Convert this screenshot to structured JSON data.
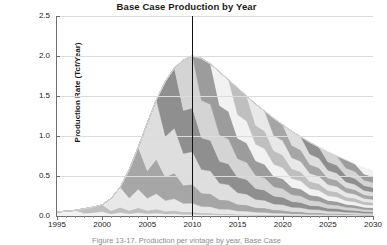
{
  "chart": {
    "title": "Base Case Production by Year",
    "caption": "Figure 13-17. Production per vintage by year, Base Case",
    "marker_line_year": 2010,
    "marker_line_color": "#111111",
    "background": "#ffffff",
    "gridline_color": "#dcdcdc",
    "axis_color": "#6f6f6f"
  },
  "chart_data": {
    "type": "area",
    "title": "Base Case Production by Year",
    "xlabel": "",
    "ylabel": "Production Rate (Tcf/Year)",
    "xlim": [
      1995,
      2030
    ],
    "ylim": [
      0.0,
      2.5
    ],
    "grid": true,
    "legend": "none",
    "stacked": true,
    "x_ticks": [
      1995,
      2000,
      2005,
      2010,
      2015,
      2020,
      2025,
      2030
    ],
    "x_tick_labels": [
      "1995",
      "2000",
      "2005",
      "2010",
      "2015",
      "2020",
      "2025",
      "2030"
    ],
    "x_minor_tick_interval": 1,
    "y_ticks": [
      0.0,
      0.5,
      1.0,
      1.5,
      2.0,
      2.5
    ],
    "y_tick_labels": [
      "0.0",
      "0.5",
      "1.0",
      "1.5",
      "2.0",
      "2.5"
    ],
    "annotations": [
      {
        "type": "vline",
        "x": 2010,
        "color": "#111111",
        "label": ""
      }
    ],
    "band_colors": [
      "#f2f2f2",
      "#bfbfbf",
      "#e8e8e8",
      "#a6a6a6",
      "#dedede",
      "#8f8f8f",
      "#d4d4d4",
      "#9c9c9c"
    ],
    "x": [
      1995,
      1996,
      1997,
      1998,
      1999,
      2000,
      2001,
      2002,
      2003,
      2004,
      2005,
      2006,
      2007,
      2008,
      2009,
      2010,
      2011,
      2012,
      2013,
      2014,
      2015,
      2016,
      2017,
      2018,
      2019,
      2020,
      2021,
      2022,
      2023,
      2024,
      2025,
      2026,
      2027,
      2028,
      2029,
      2030
    ],
    "total": [
      0.05,
      0.06,
      0.07,
      0.09,
      0.11,
      0.14,
      0.22,
      0.36,
      0.58,
      0.86,
      1.16,
      1.45,
      1.68,
      1.85,
      1.95,
      2.0,
      1.97,
      1.9,
      1.8,
      1.7,
      1.6,
      1.5,
      1.4,
      1.31,
      1.22,
      1.14,
      1.06,
      0.99,
      0.92,
      0.86,
      0.8,
      0.75,
      0.7,
      0.65,
      0.61,
      0.57
    ],
    "series": [
      {
        "name": "Vintage 1995",
        "start_year": 1995,
        "peak": 0.05,
        "values": [
          0.05,
          0.045,
          0.04,
          0.036,
          0.033,
          0.03,
          0.027,
          0.025,
          0.023,
          0.021,
          0.019,
          0.018,
          0.016,
          0.015,
          0.014,
          0.013,
          0.012,
          0.011,
          0.01,
          0.01,
          0.009,
          0.008,
          0.008,
          0.007,
          0.007,
          0.006,
          0.006,
          0.005,
          0.005,
          0.005,
          0.004,
          0.004,
          0.004,
          0.003,
          0.003,
          0.003
        ]
      },
      {
        "name": "Vintage 1998",
        "start_year": 1998,
        "peak": 0.06,
        "values": [
          0,
          0,
          0,
          0.06,
          0.054,
          0.048,
          0.043,
          0.039,
          0.035,
          0.032,
          0.029,
          0.026,
          0.024,
          0.022,
          0.02,
          0.018,
          0.017,
          0.015,
          0.014,
          0.013,
          0.012,
          0.011,
          0.01,
          0.009,
          0.009,
          0.008,
          0.007,
          0.007,
          0.006,
          0.006,
          0.005,
          0.005,
          0.005,
          0.004,
          0.004,
          0.004
        ]
      },
      {
        "name": "Vintage 2001",
        "start_year": 2001,
        "peak": 0.16,
        "values": [
          0,
          0,
          0,
          0,
          0,
          0,
          0.16,
          0.145,
          0.131,
          0.119,
          0.108,
          0.098,
          0.089,
          0.081,
          0.074,
          0.067,
          0.061,
          0.056,
          0.051,
          0.047,
          0.043,
          0.039,
          0.036,
          0.033,
          0.03,
          0.028,
          0.025,
          0.023,
          0.021,
          0.02,
          0.018,
          0.017,
          0.015,
          0.014,
          0.013,
          0.012
        ]
      },
      {
        "name": "Vintage 2003",
        "start_year": 2003,
        "peak": 0.3,
        "values": [
          0,
          0,
          0,
          0,
          0,
          0,
          0,
          0,
          0.3,
          0.27,
          0.243,
          0.219,
          0.197,
          0.178,
          0.16,
          0.144,
          0.13,
          0.117,
          0.105,
          0.095,
          0.085,
          0.077,
          0.069,
          0.062,
          0.056,
          0.05,
          0.045,
          0.041,
          0.037,
          0.033,
          0.03,
          0.027,
          0.024,
          0.022,
          0.02,
          0.018
        ]
      },
      {
        "name": "Vintage 2005",
        "start_year": 2005,
        "peak": 0.42,
        "values": [
          0,
          0,
          0,
          0,
          0,
          0,
          0,
          0,
          0,
          0,
          0.42,
          0.378,
          0.34,
          0.306,
          0.276,
          0.248,
          0.223,
          0.201,
          0.181,
          0.163,
          0.147,
          0.132,
          0.119,
          0.107,
          0.096,
          0.086,
          0.078,
          0.07,
          0.063,
          0.057,
          0.051,
          0.046,
          0.041,
          0.037,
          0.033,
          0.03
        ]
      },
      {
        "name": "Vintage 2007",
        "start_year": 2007,
        "peak": 0.46,
        "values": [
          0,
          0,
          0,
          0,
          0,
          0,
          0,
          0,
          0,
          0,
          0,
          0,
          0.46,
          0.414,
          0.373,
          0.335,
          0.302,
          0.272,
          0.244,
          0.22,
          0.198,
          0.178,
          0.16,
          0.144,
          0.13,
          0.117,
          0.105,
          0.095,
          0.085,
          0.077,
          0.069,
          0.062,
          0.056,
          0.05,
          0.045,
          0.041
        ]
      },
      {
        "name": "Vintage 2009",
        "start_year": 2009,
        "peak": 0.44,
        "values": [
          0,
          0,
          0,
          0,
          0,
          0,
          0,
          0,
          0,
          0,
          0,
          0,
          0,
          0,
          0.44,
          0.396,
          0.356,
          0.321,
          0.289,
          0.26,
          0.234,
          0.21,
          0.189,
          0.17,
          0.153,
          0.138,
          0.124,
          0.112,
          0.101,
          0.091,
          0.082,
          0.073,
          0.066,
          0.059,
          0.053,
          0.048
        ]
      },
      {
        "name": "Vintage 2011",
        "start_year": 2011,
        "peak": 0.4,
        "values": [
          0,
          0,
          0,
          0,
          0,
          0,
          0,
          0,
          0,
          0,
          0,
          0,
          0,
          0,
          0,
          0,
          0.4,
          0.36,
          0.324,
          0.292,
          0.262,
          0.236,
          0.213,
          0.191,
          0.172,
          0.155,
          0.139,
          0.125,
          0.113,
          0.102,
          0.092,
          0.082,
          0.074,
          0.067,
          0.06,
          0.054
        ]
      },
      {
        "name": "Vintage 2013",
        "start_year": 2013,
        "peak": 0.37,
        "values": [
          0,
          0,
          0,
          0,
          0,
          0,
          0,
          0,
          0,
          0,
          0,
          0,
          0,
          0,
          0,
          0,
          0,
          0,
          0.37,
          0.333,
          0.3,
          0.27,
          0.243,
          0.219,
          0.197,
          0.177,
          0.159,
          0.143,
          0.129,
          0.116,
          0.105,
          0.094,
          0.085,
          0.076,
          0.069,
          0.062
        ]
      },
      {
        "name": "Vintage 2015",
        "start_year": 2015,
        "peak": 0.34,
        "values": [
          0,
          0,
          0,
          0,
          0,
          0,
          0,
          0,
          0,
          0,
          0,
          0,
          0,
          0,
          0,
          0,
          0,
          0,
          0,
          0,
          0.34,
          0.306,
          0.275,
          0.248,
          0.223,
          0.201,
          0.181,
          0.163,
          0.146,
          0.132,
          0.119,
          0.107,
          0.096,
          0.086,
          0.078,
          0.07
        ]
      },
      {
        "name": "Vintage 2017",
        "start_year": 2017,
        "peak": 0.31,
        "values": [
          0,
          0,
          0,
          0,
          0,
          0,
          0,
          0,
          0,
          0,
          0,
          0,
          0,
          0,
          0,
          0,
          0,
          0,
          0,
          0,
          0,
          0,
          0.31,
          0.279,
          0.251,
          0.226,
          0.203,
          0.183,
          0.165,
          0.148,
          0.133,
          0.12,
          0.108,
          0.097,
          0.087,
          0.079
        ]
      },
      {
        "name": "Vintage 2019",
        "start_year": 2019,
        "peak": 0.28,
        "values": [
          0,
          0,
          0,
          0,
          0,
          0,
          0,
          0,
          0,
          0,
          0,
          0,
          0,
          0,
          0,
          0,
          0,
          0,
          0,
          0,
          0,
          0,
          0,
          0,
          0.28,
          0.252,
          0.227,
          0.204,
          0.184,
          0.165,
          0.149,
          0.134,
          0.12,
          0.108,
          0.098,
          0.088
        ]
      },
      {
        "name": "Vintage 2021",
        "start_year": 2021,
        "peak": 0.26,
        "values": [
          0,
          0,
          0,
          0,
          0,
          0,
          0,
          0,
          0,
          0,
          0,
          0,
          0,
          0,
          0,
          0,
          0,
          0,
          0,
          0,
          0,
          0,
          0,
          0,
          0,
          0,
          0.26,
          0.234,
          0.211,
          0.19,
          0.171,
          0.153,
          0.138,
          0.124,
          0.112,
          0.101
        ]
      },
      {
        "name": "Vintage 2023",
        "start_year": 2023,
        "peak": 0.24,
        "values": [
          0,
          0,
          0,
          0,
          0,
          0,
          0,
          0,
          0,
          0,
          0,
          0,
          0,
          0,
          0,
          0,
          0,
          0,
          0,
          0,
          0,
          0,
          0,
          0,
          0,
          0,
          0,
          0,
          0.24,
          0.216,
          0.194,
          0.175,
          0.157,
          0.142,
          0.127,
          0.115
        ]
      },
      {
        "name": "Vintage 2025",
        "start_year": 2025,
        "peak": 0.22,
        "values": [
          0,
          0,
          0,
          0,
          0,
          0,
          0,
          0,
          0,
          0,
          0,
          0,
          0,
          0,
          0,
          0,
          0,
          0,
          0,
          0,
          0,
          0,
          0,
          0,
          0,
          0,
          0,
          0,
          0,
          0,
          0.22,
          0.198,
          0.178,
          0.16,
          0.144,
          0.13
        ]
      },
      {
        "name": "Vintage 2027",
        "start_year": 2027,
        "peak": 0.2,
        "values": [
          0,
          0,
          0,
          0,
          0,
          0,
          0,
          0,
          0,
          0,
          0,
          0,
          0,
          0,
          0,
          0,
          0,
          0,
          0,
          0,
          0,
          0,
          0,
          0,
          0,
          0,
          0,
          0,
          0,
          0,
          0,
          0,
          0.2,
          0.18,
          0.162,
          0.146
        ]
      },
      {
        "name": "Vintage 2029",
        "start_year": 2029,
        "peak": 0.18,
        "values": [
          0,
          0,
          0,
          0,
          0,
          0,
          0,
          0,
          0,
          0,
          0,
          0,
          0,
          0,
          0,
          0,
          0,
          0,
          0,
          0,
          0,
          0,
          0,
          0,
          0,
          0,
          0,
          0,
          0,
          0,
          0,
          0,
          0,
          0,
          0.18,
          0.162
        ]
      }
    ]
  }
}
